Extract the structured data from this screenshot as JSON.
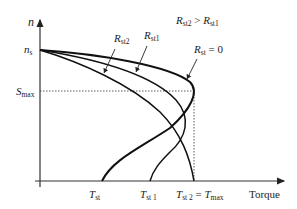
{
  "diagram": {
    "axes": {
      "y_label": "n",
      "x_label": "Torque"
    },
    "y_ticks": [
      {
        "main": "n",
        "sub": "s"
      },
      {
        "main": "S",
        "sub": "max"
      }
    ],
    "x_ticks": [
      {
        "main": "T",
        "sub": "st"
      },
      {
        "main": "T",
        "sub": "st 1"
      },
      {
        "main": "T",
        "sub": "st 2",
        "eq": " = ",
        "main2": "T",
        "sub2": "max"
      }
    ],
    "curve_labels": [
      {
        "main": "R",
        "sub": "st2"
      },
      {
        "main": "R",
        "sub": "st1"
      },
      {
        "main": "R",
        "sub": "st",
        "suffix": " = 0"
      }
    ],
    "relation": {
      "left_main": "R",
      "left_sub": "st2",
      "op": " > ",
      "right_main": "R",
      "right_sub": "st1"
    },
    "colors": {
      "line": "#1a1a1a",
      "axis": "#333333"
    }
  }
}
